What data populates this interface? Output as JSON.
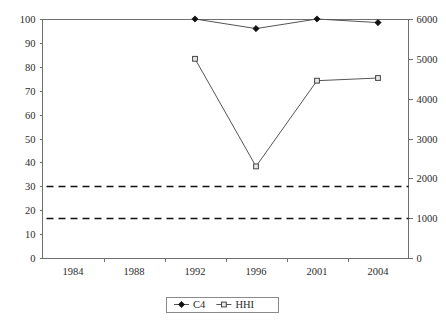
{
  "chart_data": {
    "type": "line",
    "title": "",
    "subtitle": "",
    "xlabel": "",
    "ylabel": "",
    "ylabel_right": "",
    "grid": false,
    "legend_position": "bottom-center",
    "categories": [
      "1984",
      "1988",
      "1992",
      "1996",
      "2001",
      "2004"
    ],
    "left_axis": {
      "name": "C4",
      "min": 0,
      "max": 100,
      "step": 10,
      "ticks": [
        "0",
        "10",
        "20",
        "30",
        "40",
        "50",
        "60",
        "70",
        "80",
        "90",
        "100"
      ]
    },
    "right_axis": {
      "name": "HHI",
      "min": 0,
      "max": 6000,
      "step": 1000,
      "ticks": [
        "0",
        "1000",
        "2000",
        "3000",
        "4000",
        "5000",
        "6000"
      ]
    },
    "series": [
      {
        "name": "C4",
        "axis": "left",
        "marker": "filled-diamond",
        "x": [
          "1992",
          "1996",
          "2001",
          "2004"
        ],
        "values": [
          100,
          96,
          100,
          98.5
        ]
      },
      {
        "name": "HHI",
        "axis": "right",
        "marker": "open-square",
        "x": [
          "1992",
          "1996",
          "2001",
          "2004"
        ],
        "values": [
          5000,
          2300,
          4450,
          4520
        ]
      }
    ],
    "reference_lines": [
      {
        "name": "hhi-1800-threshold",
        "axis": "right",
        "value": 1800,
        "style": "dashed"
      },
      {
        "name": "hhi-1000-threshold",
        "axis": "right",
        "value": 1000,
        "style": "dashed"
      }
    ],
    "legend": [
      {
        "label": "C4",
        "marker": "filled-diamond"
      },
      {
        "label": "HHI",
        "marker": "open-square"
      }
    ]
  },
  "axis_labels": {
    "left": [
      "100",
      "90",
      "80",
      "70",
      "60",
      "50",
      "40",
      "30",
      "20",
      "10",
      "0"
    ],
    "right": [
      "6000",
      "5000",
      "4000",
      "3000",
      "2000",
      "1000",
      "0"
    ],
    "x": [
      "1984",
      "1988",
      "1992",
      "1996",
      "2001",
      "2004"
    ]
  },
  "legend_labels": {
    "c4": "C4",
    "hhi": "HHI"
  }
}
